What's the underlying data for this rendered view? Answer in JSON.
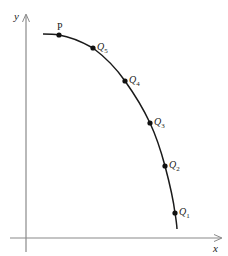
{
  "axes": {
    "x_label": "x",
    "y_label": "y",
    "axis_color": "#8a8a8a"
  },
  "curve": {
    "color": "#1a1a1a",
    "path": [
      [
        43,
        34
      ],
      [
        59,
        35
      ],
      [
        93,
        48
      ],
      [
        125,
        81
      ],
      [
        150,
        123
      ],
      [
        165,
        166
      ],
      [
        175,
        213
      ],
      [
        177,
        229
      ]
    ]
  },
  "points": [
    {
      "label": "P",
      "sub": "",
      "x": 59,
      "y": 35
    },
    {
      "label": "Q",
      "sub": "5",
      "x": 93,
      "y": 48
    },
    {
      "label": "Q",
      "sub": "4",
      "x": 125,
      "y": 81
    },
    {
      "label": "Q",
      "sub": "3",
      "x": 150,
      "y": 123
    },
    {
      "label": "Q",
      "sub": "2",
      "x": 165,
      "y": 166
    },
    {
      "label": "Q",
      "sub": "1",
      "x": 175,
      "y": 213
    }
  ]
}
